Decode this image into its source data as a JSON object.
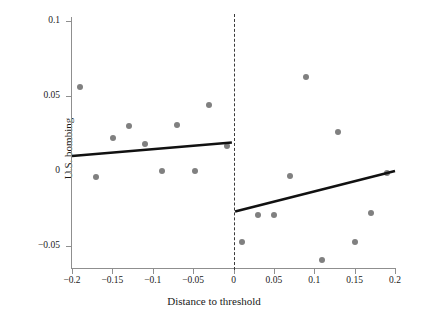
{
  "chart_data": {
    "type": "scatter",
    "title": "",
    "xlabel": "Distance to threshold",
    "ylabel": "U.S. bombing",
    "xlim": [
      -0.2,
      0.2
    ],
    "ylim": [
      -0.065,
      0.1
    ],
    "xticks": [
      -0.2,
      -0.15,
      -0.1,
      -0.05,
      0,
      0.05,
      0.1,
      0.15,
      0.2
    ],
    "xticklabels": [
      "−0.2",
      "−0.15",
      "−0.1",
      "−0.05",
      "0",
      "0.05",
      "0.1",
      "0.15",
      "0.2"
    ],
    "yticks": [
      0.1,
      0.05,
      0,
      -0.05
    ],
    "yticklabels": [
      "0.1",
      "0.05",
      "0",
      "−0.05"
    ],
    "grid": false,
    "legend": null,
    "point_color": "#808080",
    "line_color": "#111111",
    "threshold_color": "#3a3a3a",
    "axis_color": "#8f8f8f",
    "threshold": 0,
    "threshold_style": "dashed",
    "series": [
      {
        "name": "Binned means (left of threshold)",
        "points": [
          {
            "x": -0.19,
            "y": 0.056
          },
          {
            "x": -0.17,
            "y": -0.004
          },
          {
            "x": -0.149,
            "y": 0.022
          },
          {
            "x": -0.13,
            "y": 0.03
          },
          {
            "x": -0.109,
            "y": 0.018
          },
          {
            "x": -0.089,
            "y": 0.0
          },
          {
            "x": -0.07,
            "y": 0.031
          },
          {
            "x": -0.048,
            "y": 0.0
          },
          {
            "x": -0.03,
            "y": 0.044
          },
          {
            "x": -0.008,
            "y": 0.017
          }
        ]
      },
      {
        "name": "Binned means (right of threshold)",
        "points": [
          {
            "x": 0.01,
            "y": -0.047
          },
          {
            "x": 0.03,
            "y": -0.029
          },
          {
            "x": 0.05,
            "y": -0.029
          },
          {
            "x": 0.07,
            "y": -0.003
          },
          {
            "x": 0.09,
            "y": 0.063
          },
          {
            "x": 0.11,
            "y": -0.059
          },
          {
            "x": 0.13,
            "y": 0.026
          },
          {
            "x": 0.15,
            "y": -0.047
          },
          {
            "x": 0.17,
            "y": -0.028
          },
          {
            "x": 0.19,
            "y": -0.001
          }
        ]
      }
    ],
    "fit_lines": [
      {
        "name": "Left linear fit",
        "x_start": -0.2,
        "y_start": 0.01,
        "x_end": -0.002,
        "y_end": 0.019
      },
      {
        "name": "Right linear fit",
        "x_start": 0.002,
        "y_start": -0.027,
        "x_end": 0.2,
        "y_end": 0.0
      }
    ],
    "discontinuity": {
      "left_limit": 0.019,
      "right_limit": -0.027,
      "jump": -0.046
    }
  }
}
